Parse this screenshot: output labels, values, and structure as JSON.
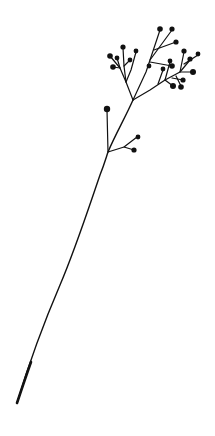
{
  "image": {
    "subject": "botanical line drawing of a baby's breath sprig",
    "background": "#ffffff",
    "ink": "#111111"
  },
  "stem": {
    "path": "M17 403 C 30 360, 45 320, 60 285 C 75 250, 88 210, 100 175 C 104 165, 106 158, 108 152 C 115 135, 125 118, 133 100"
  },
  "branches": [
    "M108 152 L107 110",
    "M108 152 L124 147 L137 137",
    "M124 147 L134 150",
    "M133 100 L126 82 L120 68 L110 56",
    "M120 68 L113 67",
    "M126 82 L124 66 L123 48",
    "M124 66 L130 60",
    "M126 82 L131 70 L136 52",
    "M120 68 L117 58",
    "M133 100 L146 72 L160 30",
    "M150 60 L172 30",
    "M154 50 L176 42",
    "M150 62 L172 66",
    "M133 100 L150 90 L165 80 L173 86",
    "M158 84 L163 70",
    "M165 80 L170 62",
    "M165 80 L180 72 L190 60",
    "M180 72 L192 72",
    "M180 72 L184 52",
    "M184 64 L198 55",
    "M172 78 L183 80",
    "M176 76 L181 86"
  ],
  "dots": [
    [
      107,
      109,
      3.2
    ],
    [
      138,
      137,
      2.4
    ],
    [
      134,
      150,
      2.6
    ],
    [
      110,
      56,
      2.8
    ],
    [
      113,
      67,
      2.8
    ],
    [
      123,
      47,
      2.6
    ],
    [
      130,
      60,
      2.4
    ],
    [
      136,
      51,
      2.4
    ],
    [
      117,
      58,
      2.4
    ],
    [
      160,
      29,
      2.8
    ],
    [
      172,
      29,
      2.6
    ],
    [
      176,
      42,
      2.6
    ],
    [
      172,
      66,
      2.8
    ],
    [
      149,
      66,
      2.4
    ],
    [
      173,
      86,
      3
    ],
    [
      163,
      69,
      2.4
    ],
    [
      170,
      61,
      2.4
    ],
    [
      190,
      59,
      2.6
    ],
    [
      193,
      72,
      3
    ],
    [
      184,
      51,
      2.6
    ],
    [
      198,
      54,
      2.4
    ],
    [
      183,
      80,
      2.6
    ],
    [
      181,
      87,
      2.8
    ]
  ]
}
